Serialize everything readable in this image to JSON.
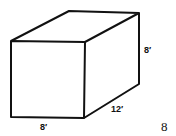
{
  "figure": {
    "shape": "rectangular prism",
    "labels": {
      "height": "8′",
      "depth": "12′",
      "width": "8′"
    },
    "figure_number": "8"
  }
}
